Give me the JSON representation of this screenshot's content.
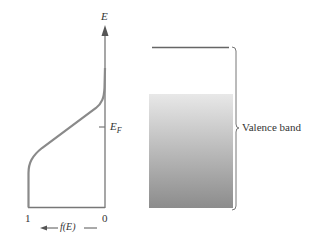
{
  "diagram": {
    "axis_label_energy": "E",
    "fermi_level_label": "E",
    "fermi_level_subscript": "F",
    "x_tick_left": "1",
    "x_tick_right": "0",
    "x_axis_label": "f(E)",
    "band_label": "Valence band",
    "colors": {
      "line": "#777777",
      "curve": "#8a8a8a",
      "band_top": "#e6e6e6",
      "band_bottom": "#8e8e8e",
      "text": "#333333"
    }
  }
}
